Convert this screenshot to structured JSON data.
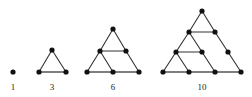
{
  "figure": {
    "name": "triangular-numbers-dot-diagram",
    "background_color": "#ffffff",
    "dot_color": "#111111",
    "edge_color": "#333333",
    "base_edge_color": "#555555",
    "label_color": "#1a1a1a",
    "dot_radius": 2.6,
    "edge_width": 1.1,
    "base_edge_width": 1.6,
    "width": 252,
    "height": 97
  },
  "chart_data": {
    "type": "diagram",
    "title": "",
    "subtitle": "",
    "xlabel": "",
    "ylabel": "",
    "sequence_name": "triangular numbers",
    "categories": [
      "1",
      "2",
      "3",
      "4"
    ],
    "values": [
      1,
      3,
      6,
      10
    ],
    "labels": [
      "1",
      "3",
      "6",
      "10"
    ],
    "dot_counts": [
      1,
      3,
      6,
      10
    ],
    "rows_per_figure": [
      1,
      2,
      3,
      4
    ]
  },
  "figures": [
    {
      "id": "figure-1",
      "label": "1",
      "label_x": 13,
      "label_y": 82,
      "dot_count": 1,
      "rows": 1,
      "dots": [
        {
          "id": "f1-r1-c1",
          "x": 13,
          "y": 72
        }
      ],
      "edges": [],
      "base_edges": []
    },
    {
      "id": "figure-2",
      "label": "3",
      "label_x": 52,
      "label_y": 82,
      "dot_count": 3,
      "rows": 2,
      "dots": [
        {
          "id": "f2-r1-c1",
          "x": 52,
          "y": 50
        },
        {
          "id": "f2-r2-c1",
          "x": 39,
          "y": 72
        },
        {
          "id": "f2-r2-c2",
          "x": 66,
          "y": 72
        }
      ],
      "edges": [
        {
          "from": "f2-r1-c1",
          "to": "f2-r2-c1"
        },
        {
          "from": "f2-r1-c1",
          "to": "f2-r2-c2"
        }
      ],
      "base_edges": [
        {
          "from": "f2-r2-c1",
          "to": "f2-r2-c2"
        }
      ]
    },
    {
      "id": "figure-3",
      "label": "6",
      "label_x": 113,
      "label_y": 82,
      "dot_count": 6,
      "rows": 3,
      "dots": [
        {
          "id": "f3-r1-c1",
          "x": 113,
          "y": 29
        },
        {
          "id": "f3-r2-c1",
          "x": 100,
          "y": 51
        },
        {
          "id": "f3-r2-c2",
          "x": 126,
          "y": 51
        },
        {
          "id": "f3-r3-c1",
          "x": 87,
          "y": 72
        },
        {
          "id": "f3-r3-c2",
          "x": 113,
          "y": 72
        },
        {
          "id": "f3-r3-c3",
          "x": 139,
          "y": 72
        }
      ],
      "edges": [
        {
          "from": "f3-r1-c1",
          "to": "f3-r2-c1"
        },
        {
          "from": "f3-r1-c1",
          "to": "f3-r2-c2"
        },
        {
          "from": "f3-r2-c1",
          "to": "f3-r3-c1"
        },
        {
          "from": "f3-r2-c1",
          "to": "f3-r3-c2"
        },
        {
          "from": "f3-r2-c2",
          "to": "f3-r3-c3"
        },
        {
          "from": "f3-r2-c1",
          "to": "f3-r2-c2"
        }
      ],
      "base_edges": [
        {
          "from": "f3-r3-c1",
          "to": "f3-r3-c3"
        }
      ]
    },
    {
      "id": "figure-4",
      "label": "10",
      "label_x": 202,
      "label_y": 82,
      "dot_count": 10,
      "rows": 4,
      "dots": [
        {
          "id": "f4-r1-c1",
          "x": 202,
          "y": 11
        },
        {
          "id": "f4-r2-c1",
          "x": 189,
          "y": 32
        },
        {
          "id": "f4-r2-c2",
          "x": 215,
          "y": 32
        },
        {
          "id": "f4-r3-c1",
          "x": 176,
          "y": 52
        },
        {
          "id": "f4-r3-c2",
          "x": 202,
          "y": 52
        },
        {
          "id": "f4-r3-c3",
          "x": 228,
          "y": 52
        },
        {
          "id": "f4-r4-c1",
          "x": 163,
          "y": 72
        },
        {
          "id": "f4-r4-c2",
          "x": 189,
          "y": 72
        },
        {
          "id": "f4-r4-c3",
          "x": 215,
          "y": 72
        },
        {
          "id": "f4-r4-c4",
          "x": 241,
          "y": 72
        }
      ],
      "edges": [
        {
          "from": "f4-r1-c1",
          "to": "f4-r2-c1"
        },
        {
          "from": "f4-r1-c1",
          "to": "f4-r2-c2"
        },
        {
          "from": "f4-r2-c1",
          "to": "f4-r3-c1"
        },
        {
          "from": "f4-r2-c1",
          "to": "f4-r3-c2"
        },
        {
          "from": "f4-r2-c2",
          "to": "f4-r3-c3"
        },
        {
          "from": "f4-r2-c1",
          "to": "f4-r2-c2"
        },
        {
          "from": "f4-r3-c1",
          "to": "f4-r4-c1"
        },
        {
          "from": "f4-r3-c1",
          "to": "f4-r4-c2"
        },
        {
          "from": "f4-r3-c2",
          "to": "f4-r4-c3"
        },
        {
          "from": "f4-r3-c3",
          "to": "f4-r4-c4"
        },
        {
          "from": "f4-r3-c1",
          "to": "f4-r3-c2"
        }
      ],
      "base_edges": [
        {
          "from": "f4-r4-c1",
          "to": "f4-r4-c4"
        }
      ]
    }
  ]
}
